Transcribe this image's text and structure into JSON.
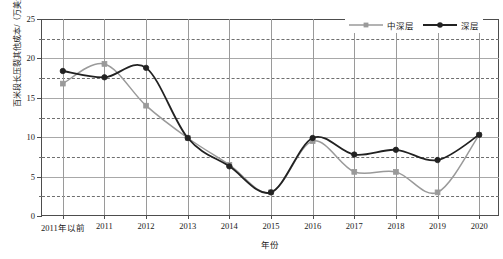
{
  "chart_data": {
    "type": "line",
    "title": "",
    "xlabel": "年份",
    "ylabel": "百米段长压裂其他成本/（万美元/100m）",
    "categories": [
      "2011年以前",
      "2011",
      "2012",
      "2013",
      "2014",
      "2015",
      "2016",
      "2017",
      "2018",
      "2019",
      "2020"
    ],
    "ylim": [
      0,
      25
    ],
    "yticks": [
      0,
      5,
      10,
      15,
      20,
      25
    ],
    "yticks_minor": [
      2.5,
      7.5,
      12.5,
      17.5,
      22.5
    ],
    "grid": true,
    "legend_position": "top-right",
    "series": [
      {
        "name": "中深层",
        "color": "#9a9a9a",
        "marker": "square",
        "values": [
          16.8,
          19.3,
          14.0,
          9.9,
          6.5,
          3.0,
          9.5,
          5.6,
          5.6,
          3.0,
          10.3
        ]
      },
      {
        "name": "深层",
        "color": "#222222",
        "marker": "circle",
        "values": [
          18.4,
          17.6,
          18.8,
          9.9,
          6.3,
          3.0,
          9.9,
          7.8,
          8.4,
          7.1,
          10.3
        ]
      }
    ]
  },
  "axis": {
    "y_title": "百米段长压裂其他成本/（万美元/100m）",
    "x_title": "年份",
    "y_tick_labels": [
      "0",
      "5",
      "10",
      "15",
      "20",
      "25"
    ],
    "x_tick_labels": [
      "2011年以前",
      "2011",
      "2012",
      "2013",
      "2014",
      "2015",
      "2016",
      "2017",
      "2018",
      "2019",
      "2020"
    ]
  },
  "legend": {
    "items": [
      {
        "label": "中深层",
        "color": "#9a9a9a",
        "marker": "square"
      },
      {
        "label": "深层",
        "color": "#222222",
        "marker": "circle"
      }
    ]
  },
  "colors": {
    "series_medium_deep": "#9a9a9a",
    "series_deep": "#222222",
    "axis": "#4d4d4d",
    "grid_major": "#a8a8a8",
    "grid_minor": "#6e6e6e",
    "background": "#ffffff"
  }
}
